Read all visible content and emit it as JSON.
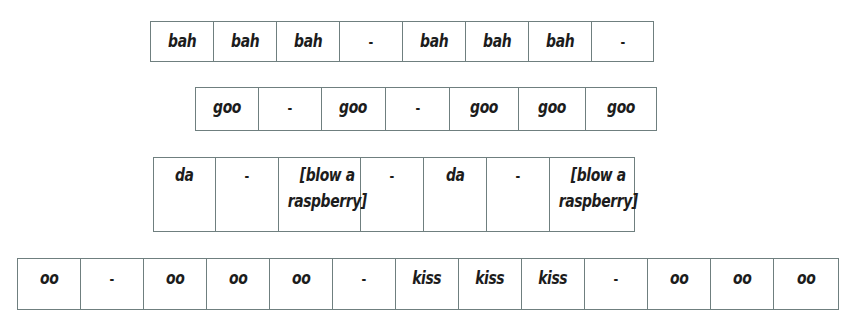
{
  "rows": [
    {
      "id": "row-1",
      "cells": [
        "bah",
        "bah",
        "bah",
        "-",
        "bah",
        "bah",
        "bah",
        "-"
      ],
      "widths": [
        63,
        63,
        63,
        63,
        63,
        63,
        63,
        62
      ]
    },
    {
      "id": "row-2",
      "cells": [
        "goo",
        "-",
        "goo",
        "-",
        "goo",
        "goo",
        "goo"
      ],
      "widths": [
        63,
        63,
        64,
        64,
        69,
        67,
        71
      ]
    },
    {
      "id": "row-3",
      "cells": [
        "da",
        "-",
        "[blow a raspberry]",
        "-",
        "da",
        "-",
        "[blow a raspberry]"
      ],
      "widths": [
        62,
        63,
        82,
        63,
        63,
        63,
        85
      ]
    },
    {
      "id": "row-4",
      "cells": [
        "oo",
        "-",
        "oo",
        "oo",
        "oo",
        "-",
        "kiss",
        "kiss",
        "kiss",
        "-",
        "oo",
        "oo",
        "oo"
      ],
      "widths": [
        63,
        63,
        63,
        63,
        63,
        63,
        63,
        63,
        63,
        63,
        63,
        63,
        65
      ]
    }
  ]
}
